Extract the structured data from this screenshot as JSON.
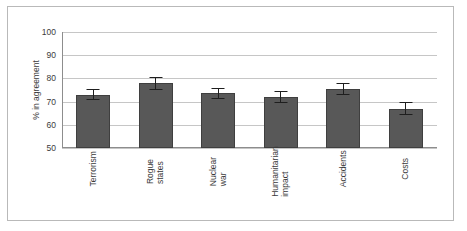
{
  "chart_data": {
    "type": "bar",
    "title": "",
    "xlabel": "",
    "ylabel": "% in agreement",
    "ylim": [
      50,
      100
    ],
    "yticks": [
      50,
      60,
      70,
      80,
      90,
      100
    ],
    "grid": true,
    "legend": false,
    "orientation": "vertical",
    "error_bars": true,
    "categories": [
      "Terrorism",
      "Rogue states",
      "Nuclear war",
      "Humanitarian impact",
      "Accidents",
      "Costs"
    ],
    "category_lines": [
      [
        "Terrorism"
      ],
      [
        "Rogue",
        "states"
      ],
      [
        "Nuclear",
        "war"
      ],
      [
        "Humanitarian",
        "impact"
      ],
      [
        "Accidents"
      ],
      [
        "Costs"
      ]
    ],
    "values": [
      73,
      78,
      73.5,
      72,
      75.5,
      67
    ],
    "errors": [
      2.5,
      2.8,
      2.2,
      2.5,
      2.5,
      2.8
    ],
    "series": [
      {
        "name": "% in agreement",
        "values": [
          73,
          78,
          73.5,
          72,
          75.5,
          67
        ],
        "errors": [
          2.5,
          2.8,
          2.2,
          2.5,
          2.5,
          2.8
        ]
      }
    ],
    "colors": {
      "bar_fill": "#585858",
      "bar_edge": "#3f3f3f",
      "error_bar": "#1e1e1e",
      "gridline": "#c6c6c6",
      "axis": "#8d8d8d",
      "text": "#3b3b3b",
      "frame": "#b9b9b9",
      "background": "#ffffff"
    }
  }
}
